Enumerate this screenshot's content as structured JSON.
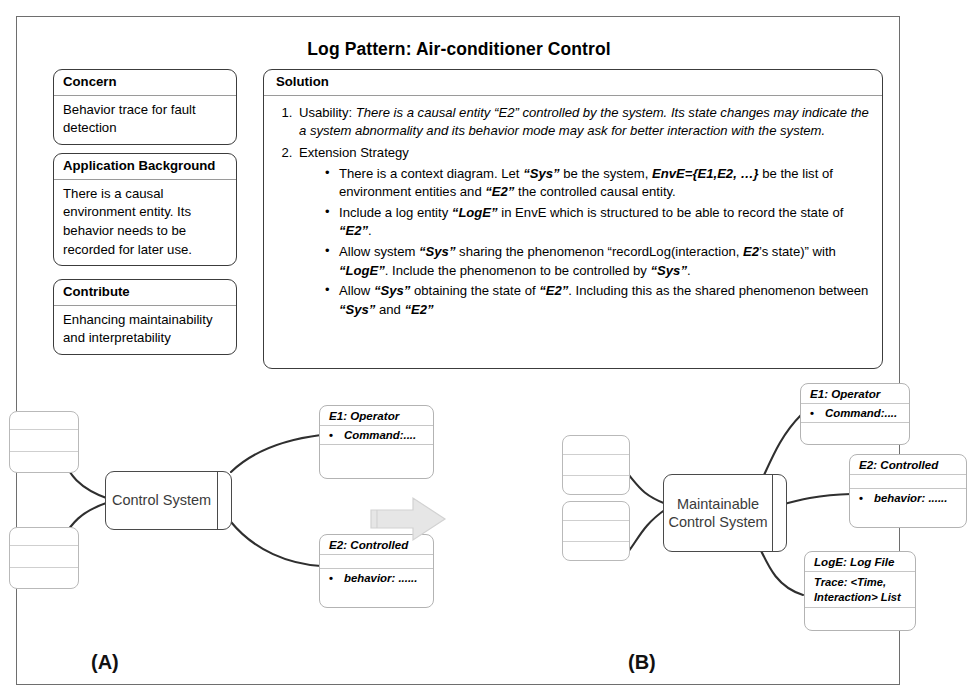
{
  "title": "Log Pattern: Air-conditioner Control",
  "cards": {
    "concern": {
      "head": "Concern",
      "body": "Behavior trace for fault detection"
    },
    "application_background": {
      "head": "Application Background",
      "body": "There is a causal environment entity. Its behavior needs to be recorded for later use."
    },
    "contribute": {
      "head": "Contribute",
      "body": "Enhancing maintainability and interpretability"
    },
    "solution": {
      "head": "Solution",
      "items": [
        {
          "number": "1.",
          "lead": "Usability:",
          "text": "There is a causal entity “E2” controlled by the system. Its state changes may indicate the a system abnormality and its behavior mode may ask for better interaction with the system."
        },
        {
          "number": "2.",
          "lead": "Extension Strategy",
          "text": "",
          "bullets": [
            "There is a context diagram. Let “Sys” be  the system, EnvE={E1,E2, …} be the list of environment entities and “E2” the controlled causal entity.",
            "Include a log entity “LogE” in EnvE which is structured to be able to record the state of “E2”.",
            "Allow system “Sys” sharing the phenomenon “recordLog(interaction, E2’s state)” with “LogE”. Include the phenomenon  to be controlled by “Sys”.",
            "Allow “Sys” obtaining the state of “E2”. Including this as the shared phenomenon between “Sys” and “E2”"
          ]
        }
      ]
    }
  },
  "diagram_a": {
    "label": "(A)",
    "machine": "Control System",
    "nodes": [
      {
        "name": "e1",
        "head": "E1: Operator",
        "rows": [
          "Command:...."
        ]
      },
      {
        "name": "e2",
        "head": "E2: Controlled",
        "rows": [
          "behavior: ......"
        ]
      }
    ],
    "blank_boxes": 2
  },
  "diagram_b": {
    "label": "(B)",
    "machine": "Maintainable Control System",
    "nodes": [
      {
        "name": "e1",
        "head": "E1: Operator",
        "rows": [
          "Command:...."
        ]
      },
      {
        "name": "e2",
        "head": "E2: Controlled",
        "rows": [
          "behavior: ......"
        ]
      },
      {
        "name": "loge",
        "head": "LogE: Log File",
        "rows": [
          "Trace: <Time, Interaction> List"
        ]
      }
    ],
    "blank_boxes": 2
  },
  "arrow": {
    "name": "transformation-arrow",
    "direction": "right",
    "color": "#e2e2e2"
  },
  "colors": {
    "frame": "#6e6e6e",
    "card_border": "#3c3c3c",
    "node_border": "#b3b3b3",
    "machine_border": "#4a4a4a",
    "connector": "#2f2f2f"
  }
}
